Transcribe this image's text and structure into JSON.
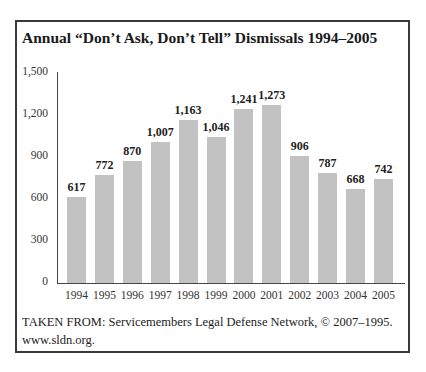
{
  "title": "Annual “Don’t Ask, Don’t Tell” Dismissals 1994–2005",
  "source": {
    "line1": "TAKEN FROM: Servicemembers Legal Defense Network, © 2007–1995.",
    "line2": "www.sldn.org."
  },
  "colors": {
    "bar": "#c2c2c2",
    "axis": "#444444",
    "frame": "#3a3a3a"
  },
  "chart_data": {
    "type": "bar",
    "title": "Annual “Don’t Ask, Don’t Tell” Dismissals 1994–2005",
    "xlabel": "",
    "ylabel": "",
    "categories": [
      "1994",
      "1995",
      "1996",
      "1997",
      "1998",
      "1999",
      "2000",
      "2001",
      "2002",
      "2003",
      "2004",
      "2005"
    ],
    "values": [
      617,
      772,
      870,
      1007,
      1163,
      1046,
      1241,
      1273,
      906,
      787,
      668,
      742
    ],
    "value_labels": [
      "617",
      "772",
      "870",
      "1,007",
      "1,163",
      "1,046",
      "1,241",
      "1,273",
      "906",
      "787",
      "668",
      "742"
    ],
    "ylim": [
      0,
      1500
    ],
    "yticks": [
      0,
      300,
      600,
      900,
      1200,
      1500
    ],
    "ytick_labels": [
      "0",
      "300",
      "600",
      "900",
      "1,200",
      "1,500"
    ],
    "grid": false,
    "legend": null
  }
}
